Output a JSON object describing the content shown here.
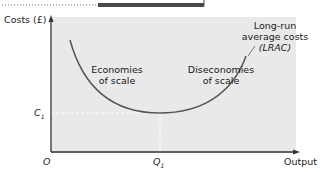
{
  "diagram": {
    "y_axis_label": "Costs (£)",
    "x_axis_label": "Output",
    "origin_label": "O",
    "c1_label": "C",
    "c1_sub": "1",
    "q1_label": "Q",
    "q1_sub": "1",
    "curve_label_line1": "Long-run",
    "curve_label_line2": "average costs",
    "curve_label_line3": "(LRAC)",
    "left_region_line1": "Economies",
    "left_region_line2": "of scale",
    "right_region_line1": "Diseconomies",
    "right_region_line2": "of scale",
    "colors": {
      "plot_background": "#e9e9e9",
      "curve": "#555555",
      "axis": "#333333",
      "dashed_guide": "#ffffff",
      "header_bar": "#4a4a4a"
    }
  }
}
